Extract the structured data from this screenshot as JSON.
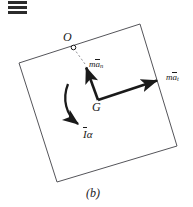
{
  "figure": {
    "caption": "(b)",
    "width": 193,
    "height": 207,
    "background_color": "#ffffff",
    "ink_color": "#1a1a1a",
    "plate_outline_color": "#55555a"
  },
  "menu_icon": {
    "name": "hamburger-bars-icon",
    "bar_count": 3,
    "color": "#2b2b2b"
  },
  "points": [
    {
      "id": "O",
      "label": "O",
      "x": 73,
      "y": 47,
      "marker": "open-circle",
      "description": "fixed point on upper-left edge of plate"
    },
    {
      "id": "G",
      "label": "G",
      "x": 98,
      "y": 100,
      "marker": "none",
      "description": "mass center of the plate"
    }
  ],
  "plate": {
    "name": "rigid-plate",
    "shape": "rotated-square",
    "corners": [
      {
        "x": 140,
        "y": 24
      },
      {
        "x": 177,
        "y": 146
      },
      {
        "x": 57,
        "y": 182
      },
      {
        "x": 19,
        "y": 63
      }
    ],
    "fill": "#ffffff",
    "stroke": "#55555a"
  },
  "dashed_line": {
    "name": "construction-line-OG",
    "from": {
      "x": 73,
      "y": 47
    },
    "to": {
      "x": 85,
      "y": 64
    },
    "style": "dashed"
  },
  "vectors": [
    {
      "id": "man",
      "name": "normal-acceleration-vector",
      "label_prefix": "m",
      "label_overbar": "a",
      "label_subscript": "n",
      "label_plain": "m ān",
      "from": {
        "x": 98,
        "y": 100
      },
      "to": {
        "x": 85,
        "y": 64
      },
      "direction": "up-left",
      "label_x": 89,
      "label_y": 60
    },
    {
      "id": "mat",
      "name": "tangential-acceleration-vector",
      "label_prefix": "m",
      "label_overbar": "a",
      "label_subscript": "t",
      "label_plain": "m āt",
      "from": {
        "x": 98,
        "y": 100
      },
      "to": {
        "x": 162,
        "y": 79
      },
      "direction": "right-up",
      "label_x": 166,
      "label_y": 73
    },
    {
      "id": "Ialpha",
      "name": "angular-momentum-couple-arc",
      "label_overbar": "I",
      "label_symbol": "α",
      "label_plain": "Īα",
      "style": "curved-arrow",
      "sweep": "clockwise-around-G",
      "label_x": 83,
      "label_y": 129
    }
  ],
  "labels": {
    "point_O": "O",
    "point_G": "G",
    "caption": "(b)",
    "vector_man_prefix": "m",
    "vector_man_base": "a",
    "vector_man_sub": "n",
    "vector_mat_prefix": "m",
    "vector_mat_base": "a",
    "vector_mat_sub": "t",
    "couple_base": "I",
    "couple_symbol": "α"
  }
}
